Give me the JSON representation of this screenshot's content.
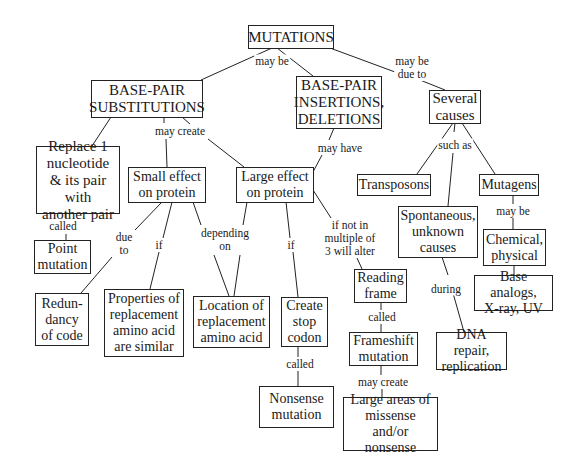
{
  "nodes": {
    "mutations": "MUTATIONS",
    "substitutions": "BASE-PAIR\nSUBSTITUTIONS",
    "insertions": "BASE-PAIR\nINSERTIONS,\nDELETIONS",
    "several_causes": "Several\ncauses",
    "replace": "Replace 1\nnucleotide\n& its pair with\nanother pair",
    "small_effect": "Small effect\non protein",
    "large_effect": "Large effect\non protein",
    "transposons": "Transposons",
    "mutagens": "Mutagens",
    "spontaneous": "Spontaneous,\nunknown\ncauses",
    "chemical": "Chemical,\nphysical",
    "base_analogs": "Base analogs,\nX-ray, UV",
    "point_mutation": "Point\nmutation",
    "redundancy": "Redun-\ndancy\nof code",
    "properties": "Properties of\nreplacement\namino acid\nare similar",
    "location": "Location of\nreplacement\namino acid",
    "stop_codon": "Create\nstop\ncodon",
    "reading_frame": "Reading\nframe",
    "frameshift": "Frameshift\nmutation",
    "dna_repair": "DNA repair,\nreplication",
    "nonsense": "Nonsense\nmutation",
    "large_areas": "Large areas of\nmissense\nand/or nonsense"
  },
  "links": {
    "may_be_1": "may be",
    "may_be_due_to": "may be\n  due to",
    "may_create_1": "may create",
    "may_have": "may have",
    "such_as": "such as",
    "called_1": "called",
    "due_to": "due\nto",
    "if_1": "if",
    "depending_on": "depending\non",
    "if_2": "if",
    "if_not_in": "if not in\nmultiple of\n3 will alter",
    "may_be_2": "may be",
    "during": "during",
    "called_2": "called",
    "called_3": "called",
    "may_create_2": "may create"
  }
}
